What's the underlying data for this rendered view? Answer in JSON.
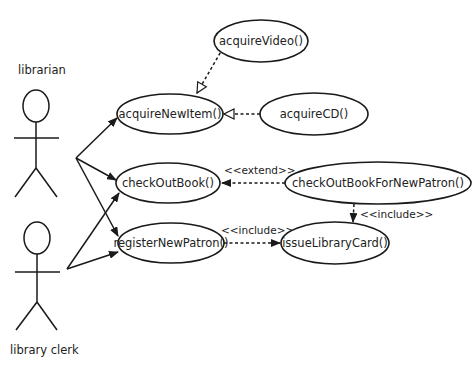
{
  "diagram": {
    "type": "UML use case diagram",
    "actors": [
      {
        "id": "librarian",
        "label": "librarian"
      },
      {
        "id": "library_clerk",
        "label": "library clerk"
      }
    ],
    "use_cases": [
      {
        "id": "acquireVideo",
        "label": "acquireVideo()"
      },
      {
        "id": "acquireNewItem",
        "label": "acquireNewItem()"
      },
      {
        "id": "acquireCD",
        "label": "acquireCD()"
      },
      {
        "id": "checkOutBook",
        "label": "checkOutBook()"
      },
      {
        "id": "checkOutBookForNewPatron",
        "label": "checkOutBookForNewPatron()"
      },
      {
        "id": "registerNewPatron",
        "label": "registerNewPatron()"
      },
      {
        "id": "issueLibraryCard",
        "label": "issueLibraryCard()"
      }
    ],
    "relationships": [
      {
        "from": "librarian",
        "to": "acquireNewItem",
        "type": "association"
      },
      {
        "from": "librarian",
        "to": "checkOutBook",
        "type": "association"
      },
      {
        "from": "librarian",
        "to": "registerNewPatron",
        "type": "association"
      },
      {
        "from": "library_clerk",
        "to": "checkOutBook",
        "type": "association"
      },
      {
        "from": "library_clerk",
        "to": "registerNewPatron",
        "type": "association"
      },
      {
        "from": "acquireVideo",
        "to": "acquireNewItem",
        "type": "generalization"
      },
      {
        "from": "acquireCD",
        "to": "acquireNewItem",
        "type": "generalization"
      },
      {
        "from": "checkOutBookForNewPatron",
        "to": "checkOutBook",
        "type": "extend",
        "label": "<<extend>>"
      },
      {
        "from": "checkOutBookForNewPatron",
        "to": "issueLibraryCard",
        "type": "include",
        "label": "<<include>>"
      },
      {
        "from": "registerNewPatron",
        "to": "issueLibraryCard",
        "type": "include",
        "label": "<<include>>"
      }
    ],
    "stereotypes": {
      "extend": "<<extend>>",
      "include_a": "<<include>>",
      "include_b": "<<include>>"
    }
  }
}
